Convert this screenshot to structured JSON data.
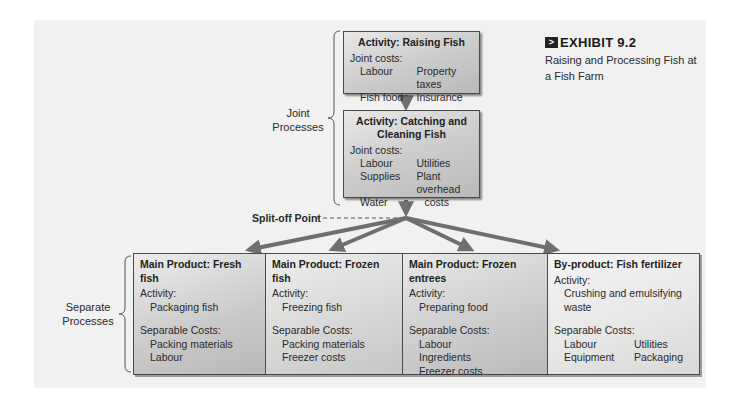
{
  "exhibit": {
    "number": "EXHIBIT 9.2",
    "caption": "Raising and Processing Fish at a Fish Farm"
  },
  "joint": {
    "label": "Joint Processes",
    "activities": [
      {
        "title": "Activity: Raising Fish",
        "costs_label": "Joint costs:",
        "costs": [
          "Labour",
          "Property taxes",
          "Fish food",
          "Insurance"
        ]
      },
      {
        "title": "Activity: Catching and Cleaning Fish",
        "costs_label": "Joint costs:",
        "costs": [
          "Labour",
          "Utilities",
          "Supplies",
          "Plant overhead",
          "Water",
          "costs"
        ]
      }
    ]
  },
  "split_off_label": "Split-off Point",
  "separate": {
    "label": "Separate Processes",
    "products": [
      {
        "title": "Main Product: Fresh fish",
        "activity_label": "Activity:",
        "activity": "Packaging fish",
        "costs_label": "Separable Costs:",
        "costs": [
          "Packing materials",
          "Labour"
        ]
      },
      {
        "title": "Main Product: Frozen fish",
        "activity_label": "Activity:",
        "activity": "Freezing fish",
        "costs_label": "Separable Costs:",
        "costs": [
          "Packing materials",
          "Freezer costs"
        ]
      },
      {
        "title": "Main Product: Frozen entrees",
        "activity_label": "Activity:",
        "activity": "Preparing food",
        "costs_label": "Separable Costs:",
        "costs": [
          "Labour",
          "Ingredients",
          "Freezer costs"
        ]
      },
      {
        "title": "By-product: Fish fertilizer",
        "activity_label": "Activity:",
        "activity": "Crushing and emulsifying waste",
        "costs_label": "Separable Costs:",
        "costs": [
          "Labour",
          "Utilities",
          "Equipment",
          "Packaging"
        ]
      }
    ]
  },
  "colors": {
    "arrow": "#6f6f6f",
    "box_border": "#4a4a4a",
    "panel_bg": "#f1f1f1"
  }
}
